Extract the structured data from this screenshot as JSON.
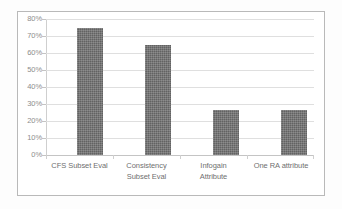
{
  "chart_data": {
    "type": "bar",
    "title": "",
    "subtitle": "",
    "xlabel": "",
    "ylabel": "",
    "categories": [
      "CFS Subset Eval",
      "Consistency Subset Eval",
      "Infogain Attribute",
      "One RA attribute"
    ],
    "category_lines": [
      [
        "CFS Subset Eval"
      ],
      [
        "Consistency",
        "Subset Eval"
      ],
      [
        "Infogain",
        "Attribute"
      ],
      [
        "One RA attribute"
      ]
    ],
    "values": [
      75,
      65,
      26.5,
      26.5
    ],
    "value_labels": [
      "75%",
      "65%",
      "26.5%",
      "26.5%"
    ],
    "ylim": [
      0,
      80
    ],
    "ytick_values": [
      80,
      70,
      60,
      50,
      40,
      30,
      20,
      10,
      0
    ],
    "ytick_labels": [
      "80%",
      "70%",
      "60%",
      "50%",
      "40%",
      "30%",
      "20%",
      "10%",
      "0%"
    ],
    "grid": true,
    "legend": false,
    "legend_position": "none",
    "series": [
      {
        "name": "",
        "values": [
          75,
          65,
          26.5,
          26.5
        ]
      }
    ]
  },
  "style": {
    "bar_color": "#6e6e6e",
    "gridline_color": "#dfdfdf",
    "axis_color": "#c4c4c4",
    "tick_label_color": "#8d8d8d",
    "category_label_color": "#6f6f6f",
    "frame_border_color": "#b9b9b9",
    "plot_background": "#ffffff",
    "figure_background": "#fdfdfd"
  }
}
